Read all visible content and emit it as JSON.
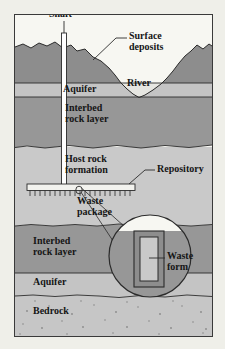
{
  "figure": {
    "type": "cross-section-diagram"
  },
  "labels": {
    "shaft": "Shaft",
    "surface_deposits": "Surface\ndeposits",
    "aquifer_upper": "Aquifer",
    "river": "River",
    "interbed_upper": "Interbed\nrock layer",
    "host_rock": "Host rock\nformation",
    "repository": "Repository",
    "waste_package": "Waste\npackage",
    "interbed_lower": "Interbed\nrock layer",
    "waste_form": "Waste\nform",
    "aquifer_lower": "Aquifer",
    "bedrock": "Bedrock"
  },
  "colors": {
    "page_background": "#efefe9",
    "frame_border": "#3a3a3a",
    "sky": "#f7f7f2",
    "surface_deposits": "#8d8d8d",
    "interbed_rock": "#979797",
    "host_rock": "#c9c9c9",
    "aquifer": "#c4c4c4",
    "bedrock": "#c6c6c6",
    "waste_package": "#8d8d8d",
    "waste_form": "#c9c9c9",
    "line": "#2b2b2b",
    "shaft_fill": "#ffffff"
  },
  "geometry": {
    "figure_width": 197,
    "figure_height": 321,
    "shaft_x": 49,
    "shaft_top": 18,
    "shaft_bottom": 172,
    "repository_left": 12,
    "repository_right": 120,
    "repository_y": 172,
    "magnifier_cx": 135,
    "magnifier_cy": 241,
    "magnifier_r": 41
  },
  "layers": [
    {
      "name": "surface-deposits",
      "top": 18,
      "bottom": 68
    },
    {
      "name": "aquifer-upper",
      "top": 68,
      "bottom": 82
    },
    {
      "name": "interbed-upper",
      "top": 82,
      "bottom": 132
    },
    {
      "name": "host-rock",
      "top": 132,
      "bottom": 210
    },
    {
      "name": "interbed-lower",
      "top": 210,
      "bottom": 258
    },
    {
      "name": "aquifer-lower",
      "top": 258,
      "bottom": 280
    },
    {
      "name": "bedrock",
      "top": 280,
      "bottom": 321
    }
  ]
}
